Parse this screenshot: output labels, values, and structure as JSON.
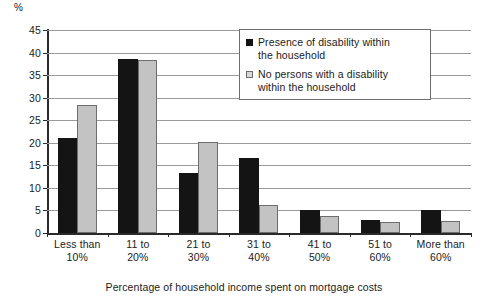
{
  "chart_data": {
    "type": "bar",
    "title": "",
    "subtitle": "",
    "xlabel": "Percentage of household income spent on mortgage costs",
    "ylabel": "%",
    "ylim": [
      0,
      45
    ],
    "ytick_step": 5,
    "yticks": [
      0,
      5,
      10,
      15,
      20,
      25,
      30,
      35,
      40,
      45
    ],
    "ytick_labels": [
      "0",
      "5",
      "10",
      "15",
      "20",
      "25",
      "30",
      "35",
      "40",
      "45"
    ],
    "grid": true,
    "legend_position": "top-right",
    "categories": [
      "Less than 10%",
      "11 to 20%",
      "21 to 30%",
      "31 to 40%",
      "41 to 50%",
      "51 to 60%",
      "More than 60%"
    ],
    "category_lines": [
      {
        "line1": "Less than",
        "line2": "10%"
      },
      {
        "line1": "11 to",
        "line2": "20%"
      },
      {
        "line1": "21 to",
        "line2": "30%"
      },
      {
        "line1": "31 to",
        "line2": "40%"
      },
      {
        "line1": "41 to",
        "line2": "50%"
      },
      {
        "line1": "51 to",
        "line2": "60%"
      },
      {
        "line1": "More than",
        "line2": "60%"
      }
    ],
    "series": [
      {
        "name": "Presence of disability within the household",
        "color": "#141414",
        "values": [
          21.0,
          38.6,
          13.2,
          16.7,
          5.0,
          2.8,
          5.0
        ]
      },
      {
        "name": "No persons with a disability within the household",
        "color": "#c3c3c3",
        "values": [
          28.3,
          38.4,
          20.2,
          6.1,
          3.8,
          2.5,
          2.7
        ]
      }
    ]
  },
  "legend": {
    "items": [
      {
        "label_line1": "Presence of disability within",
        "label_line2": "the household"
      },
      {
        "label_line1": "No persons with a disability",
        "label_line2": "within the household"
      }
    ]
  },
  "axis": {
    "unit_label": "%",
    "x_title": "Percentage of household income spent on mortgage costs"
  },
  "colors": {
    "series_dark": "#141414",
    "series_light": "#c3c3c3",
    "series_light_border": "#6d6d6d",
    "gridline": "#9a9a9a",
    "axis": "#2a2a2a",
    "background": "#ffffff"
  }
}
